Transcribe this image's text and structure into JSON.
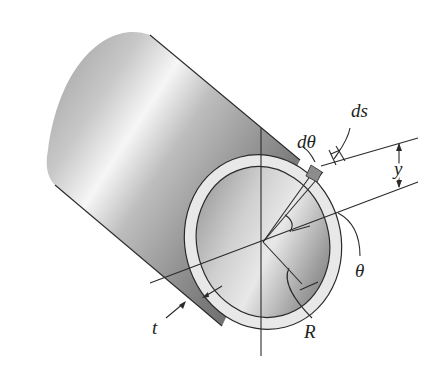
{
  "figure": {
    "labels": {
      "d_theta": "dθ",
      "ds": "ds",
      "y": "y",
      "theta": "θ",
      "t": "t",
      "R": "R"
    },
    "colors": {
      "background": "#ffffff",
      "line": "#2a2a2a",
      "ring": "#e6e6e6",
      "shade_dark": "#6e6e6e",
      "shade_light": "#f4f4f4"
    }
  }
}
